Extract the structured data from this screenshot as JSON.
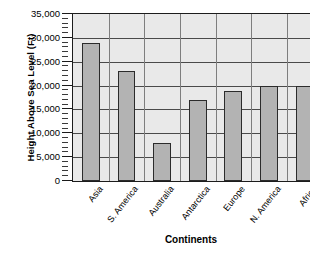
{
  "chart_data": {
    "type": "bar",
    "title": "",
    "xlabel": "Continents",
    "ylabel": "Height Above Sea Level (Ft)",
    "categories": [
      "Asia",
      "S. America",
      "Australia",
      "Antarctica",
      "Europe",
      "N. America",
      "Africa"
    ],
    "values": [
      29000,
      23000,
      8000,
      17000,
      18800,
      20000,
      20000
    ],
    "ylim": [
      0,
      35000
    ],
    "ytick_labels": [
      "0",
      "5,000",
      "10,000",
      "15,000",
      "20,000",
      "25,000",
      "30,000",
      "35,000"
    ],
    "ytick_values": [
      0,
      5000,
      10000,
      15000,
      20000,
      25000,
      30000,
      35000
    ],
    "grid": true,
    "legend": "none",
    "minor_ticks": true,
    "minor_tick_interval": 1000,
    "bar_color": "#b3b3b3",
    "bar_border_color": "#2b2b2b",
    "plot_background": "#e9e9e9",
    "axis_color": "#1c1c1c",
    "gridline_color": "#4a4a4a",
    "note": "Rightmost bar (Africa) is clipped by the image edge"
  }
}
